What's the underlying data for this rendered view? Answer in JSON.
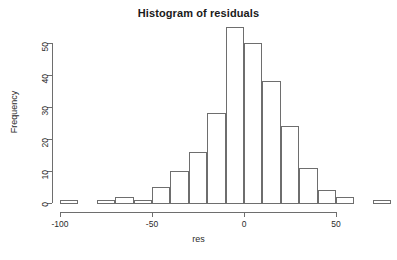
{
  "chart_data": {
    "type": "bar",
    "title": "Histogram of residuals",
    "xlabel": "res",
    "ylabel": "Frequency",
    "grid": false,
    "legend": null,
    "xlim": [
      -100,
      80
    ],
    "ylim": [
      0,
      55
    ],
    "bin_width": 10,
    "x_ticks": [
      -100,
      -50,
      0,
      50
    ],
    "x_tick_labels": [
      "-100",
      "-50",
      "0",
      "50"
    ],
    "y_ticks": [
      0,
      10,
      20,
      30,
      40,
      50
    ],
    "y_tick_labels": [
      "0",
      "10",
      "20",
      "30",
      "40",
      "50"
    ],
    "bin_edges": [
      -100,
      -90,
      -80,
      -70,
      -60,
      -50,
      -40,
      -30,
      -20,
      -10,
      0,
      10,
      20,
      30,
      40,
      50,
      60,
      70,
      80
    ],
    "categories": [
      "-100 to -90",
      "-90 to -80",
      "-80 to -70",
      "-70 to -60",
      "-60 to -50",
      "-50 to -40",
      "-40 to -30",
      "-30 to -20",
      "-20 to -10",
      "-10 to 0",
      "0 to 10",
      "10 to 20",
      "20 to 30",
      "30 to 40",
      "40 to 50",
      "50 to 60",
      "60 to 70",
      "70 to 80"
    ],
    "values": [
      1,
      0,
      1,
      2,
      1,
      5,
      10,
      16,
      28,
      55,
      50,
      38,
      24,
      11,
      4,
      2,
      0,
      1
    ],
    "colors": {
      "bar_stroke": "#6e6e6e",
      "bar_fill": "transparent",
      "axis": "#6e6e6e",
      "text": "#2b2b2b",
      "title": "#1a1a1a",
      "background": "#ffffff"
    }
  }
}
